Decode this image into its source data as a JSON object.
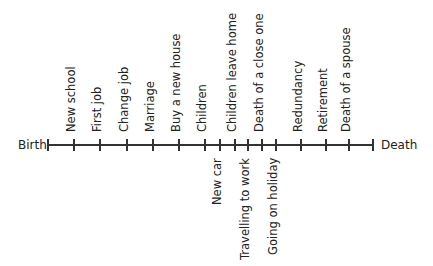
{
  "diagram": {
    "type": "life-events-timeline",
    "start_label": "Birth",
    "end_label": "Death",
    "colors": {
      "line": "#333333",
      "text": "#222222",
      "background": "#ffffff"
    },
    "axis": {
      "y": 145,
      "x_start": 48,
      "x_end": 373
    },
    "ticks_x": [
      48,
      74,
      100,
      127,
      153,
      179,
      205,
      220,
      235,
      248,
      262,
      276,
      301,
      326,
      349,
      373
    ],
    "events_above": [
      {
        "label": "New school",
        "x": 74
      },
      {
        "label": "First job",
        "x": 100
      },
      {
        "label": "Change job",
        "x": 127
      },
      {
        "label": "Marriage",
        "x": 153
      },
      {
        "label": "Buy a new house",
        "x": 179
      },
      {
        "label": "Children",
        "x": 205
      },
      {
        "label": "Children leave home",
        "x": 235
      },
      {
        "label": "Death of a close one",
        "x": 262
      },
      {
        "label": "Redundancy",
        "x": 301
      },
      {
        "label": "Retirement",
        "x": 326
      },
      {
        "label": "Death of a spouse",
        "x": 349
      }
    ],
    "events_below": [
      {
        "label": "New car",
        "x": 220
      },
      {
        "label": "Travelling to work",
        "x": 248
      },
      {
        "label": "Going on holiday",
        "x": 276
      }
    ]
  }
}
